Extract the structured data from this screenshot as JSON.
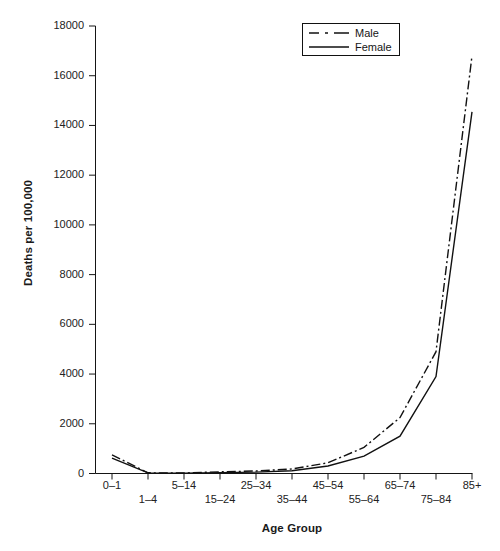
{
  "chart_data": {
    "type": "line",
    "title": "",
    "xlabel": "Age Group",
    "ylabel": "Deaths per 100,000",
    "categories": [
      "0–1",
      "1–4",
      "5–14",
      "15–24",
      "25–34",
      "35–44",
      "45–54",
      "55–64",
      "65–74",
      "75–84",
      "85+"
    ],
    "xtick_labels": [
      "0–1",
      "1–4",
      "5–14",
      "15–24",
      "25–34",
      "35–44",
      "45–54",
      "55–64",
      "65–74",
      "75–84",
      "85+"
    ],
    "ytick_labels": [
      "0",
      "2000",
      "4000",
      "6000",
      "8000",
      "10000",
      "12000",
      "14000",
      "16000",
      "18000"
    ],
    "ytick_values": [
      0,
      2000,
      4000,
      6000,
      8000,
      10000,
      12000,
      14000,
      16000,
      18000
    ],
    "ylim": [
      0,
      18000
    ],
    "grid": false,
    "legend_position": "top-right",
    "series": [
      {
        "name": "Male",
        "style": "dash-dot",
        "color": "#111111",
        "values": [
          750,
          30,
          20,
          70,
          100,
          180,
          430,
          1050,
          2250,
          4900,
          16800
        ]
      },
      {
        "name": "Female",
        "style": "solid",
        "color": "#111111",
        "values": [
          620,
          25,
          15,
          35,
          55,
          110,
          300,
          700,
          1500,
          3900,
          14550
        ]
      }
    ]
  },
  "legend": {
    "items": [
      {
        "label": "Male",
        "style": "dash-dot"
      },
      {
        "label": "Female",
        "style": "solid"
      }
    ]
  }
}
